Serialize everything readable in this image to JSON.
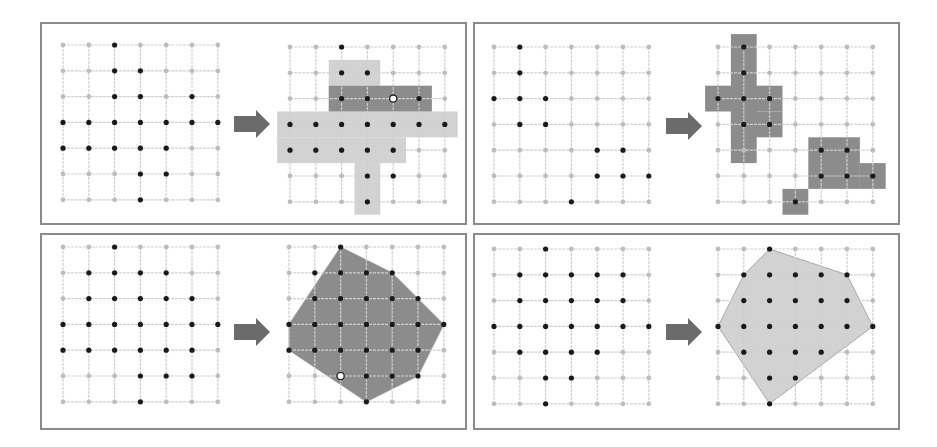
{
  "colors": {
    "panel_border": "#8a8a8a",
    "grid_line": "#cfcfcf",
    "grid_dot": "#bdbdbd",
    "point_dark": "#1a1a1a",
    "highlight_point": "#ffffff",
    "arrow": "#6b6b6b",
    "light_fill": "#d2d2d2",
    "dark_fill": "#8c8c8c"
  },
  "grid": {
    "rows": 7,
    "cols": 7
  },
  "panels": [
    {
      "id": "top-left",
      "box": [
        40,
        22,
        427,
        203
      ],
      "left_origin": [
        63,
        45
      ],
      "right_origin": [
        290,
        47
      ],
      "spacing": 25.8,
      "points": [
        [
          0,
          2
        ],
        [
          1,
          2
        ],
        [
          1,
          3
        ],
        [
          2,
          2
        ],
        [
          2,
          3
        ],
        [
          2,
          5
        ],
        [
          3,
          0
        ],
        [
          3,
          1
        ],
        [
          3,
          2
        ],
        [
          3,
          3
        ],
        [
          3,
          4
        ],
        [
          3,
          5
        ],
        [
          3,
          6
        ],
        [
          4,
          0
        ],
        [
          4,
          1
        ],
        [
          4,
          2
        ],
        [
          4,
          3
        ],
        [
          4,
          4
        ],
        [
          5,
          3
        ],
        [
          5,
          4
        ],
        [
          6,
          3
        ]
      ],
      "right_fills": [
        {
          "tone": "light",
          "cells": [
            [
              -0.5,
              1.5,
              -0.5,
              2.5
            ],
            [
              0.5,
              1.5,
              1.5,
              3.5
            ],
            [
              2.5,
              -0.5,
              3.5,
              6.5
            ],
            [
              3.5,
              -0.5,
              4.5,
              4.5
            ],
            [
              4.5,
              2.5,
              6.5,
              3.5
            ]
          ]
        },
        {
          "tone": "dark",
          "cells": [
            [
              1.5,
              1.5,
              2.5,
              5.5
            ]
          ]
        }
      ],
      "white_points": [
        [
          2,
          4
        ]
      ]
    },
    {
      "id": "top-right",
      "box": [
        473,
        22,
        427,
        203
      ],
      "left_origin": [
        494,
        47
      ],
      "right_origin": [
        718,
        47
      ],
      "spacing": 25.8,
      "points": [
        [
          0,
          1
        ],
        [
          1,
          1
        ],
        [
          2,
          0
        ],
        [
          2,
          1
        ],
        [
          2,
          2
        ],
        [
          3,
          1
        ],
        [
          3,
          2
        ],
        [
          4,
          4
        ],
        [
          4,
          5
        ],
        [
          5,
          4
        ],
        [
          5,
          5
        ],
        [
          5,
          6
        ],
        [
          6,
          3
        ]
      ],
      "right_fills": [
        {
          "tone": "dark",
          "cells": [
            [
              -0.5,
              0.5,
              4.5,
              1.5
            ],
            [
              1.5,
              -0.5,
              2.5,
              2.5
            ],
            [
              2.5,
              0.5,
              3.5,
              2.5
            ],
            [
              3.5,
              3.5,
              5.5,
              5.5
            ],
            [
              4.5,
              5.5,
              5.5,
              6.5
            ],
            [
              5.5,
              2.5,
              6.5,
              3.5
            ]
          ]
        }
      ],
      "white_points": []
    },
    {
      "id": "bottom-left",
      "box": [
        40,
        233,
        427,
        197
      ],
      "left_origin": [
        63,
        247
      ],
      "right_origin": [
        289,
        247
      ],
      "spacing": 25.8,
      "points": [
        [
          0,
          2
        ],
        [
          1,
          1
        ],
        [
          1,
          2
        ],
        [
          1,
          3
        ],
        [
          1,
          4
        ],
        [
          2,
          1
        ],
        [
          2,
          2
        ],
        [
          2,
          3
        ],
        [
          2,
          4
        ],
        [
          2,
          5
        ],
        [
          3,
          0
        ],
        [
          3,
          1
        ],
        [
          3,
          2
        ],
        [
          3,
          3
        ],
        [
          3,
          4
        ],
        [
          3,
          5
        ],
        [
          3,
          6
        ],
        [
          4,
          0
        ],
        [
          4,
          1
        ],
        [
          4,
          2
        ],
        [
          4,
          3
        ],
        [
          4,
          4
        ],
        [
          4,
          5
        ],
        [
          5,
          3
        ],
        [
          5,
          4
        ],
        [
          5,
          5
        ],
        [
          6,
          3
        ]
      ],
      "right_polygon": {
        "tone": "dark",
        "vertices": [
          [
            0,
            2
          ],
          [
            1,
            4
          ],
          [
            3,
            6
          ],
          [
            5,
            5
          ],
          [
            6,
            3
          ],
          [
            4,
            0
          ],
          [
            3,
            0
          ]
        ]
      },
      "white_points": [
        [
          5,
          2
        ]
      ]
    },
    {
      "id": "bottom-right",
      "box": [
        473,
        233,
        427,
        197
      ],
      "left_origin": [
        494,
        249
      ],
      "right_origin": [
        718,
        249
      ],
      "spacing": 25.8,
      "points": [
        [
          0,
          2
        ],
        [
          1,
          1
        ],
        [
          1,
          2
        ],
        [
          1,
          3
        ],
        [
          1,
          4
        ],
        [
          1,
          5
        ],
        [
          2,
          1
        ],
        [
          2,
          2
        ],
        [
          2,
          3
        ],
        [
          2,
          4
        ],
        [
          2,
          5
        ],
        [
          3,
          0
        ],
        [
          3,
          1
        ],
        [
          3,
          2
        ],
        [
          3,
          3
        ],
        [
          3,
          4
        ],
        [
          3,
          5
        ],
        [
          3,
          6
        ],
        [
          4,
          1
        ],
        [
          4,
          2
        ],
        [
          4,
          3
        ],
        [
          4,
          4
        ],
        [
          5,
          2
        ],
        [
          5,
          3
        ],
        [
          6,
          2
        ]
      ],
      "right_polygon": {
        "tone": "light",
        "vertices": [
          [
            0,
            2
          ],
          [
            1,
            5
          ],
          [
            3,
            6
          ],
          [
            6,
            2
          ],
          [
            3,
            0
          ],
          [
            1,
            1
          ]
        ]
      },
      "white_points": []
    }
  ],
  "arrows": [
    [
      234,
      110
    ],
    [
      666,
      112
    ],
    [
      234,
      318
    ],
    [
      666,
      318
    ]
  ]
}
